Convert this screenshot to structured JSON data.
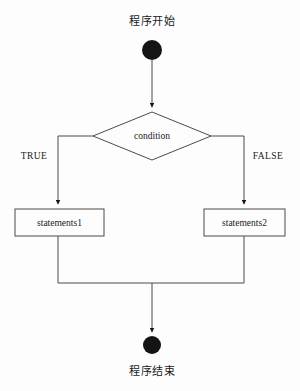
{
  "diagram": {
    "colors": {
      "background": "#fdfdfd",
      "stroke": "#4b4b4b",
      "text": "#1a1a1a",
      "terminal_fill": "#141414"
    },
    "nodes": {
      "start": {
        "label": "程序开始",
        "type": "terminator"
      },
      "decision": {
        "label": "condition",
        "type": "decision"
      },
      "process_true": {
        "label": "statements1",
        "type": "process"
      },
      "process_false": {
        "label": "statements2",
        "type": "process"
      },
      "end": {
        "label": "程序结束",
        "type": "terminator"
      }
    },
    "edges": {
      "true_branch_label": "TRUE",
      "false_branch_label": "FALSE"
    }
  }
}
